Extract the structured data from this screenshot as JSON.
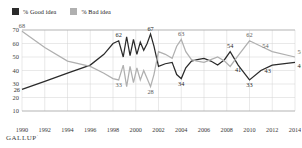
{
  "legend": {
    "entries": [
      {
        "label": "% Good idea",
        "color": "#2b2b2b",
        "key": "good"
      },
      {
        "label": "% Bad idea",
        "color": "#b0b0b0",
        "key": "bad"
      }
    ]
  },
  "brand": {
    "name": "GALLUP",
    "mark": "·"
  },
  "colors": {
    "good": "#2b2b2b",
    "bad": "#b0b0b0",
    "grid": "#d2d2d2",
    "axis": "#9a9a9a",
    "background": "#ffffff"
  },
  "chart_data": {
    "type": "line",
    "title": "",
    "subtitle": "",
    "xlabel": "",
    "ylabel": "",
    "xlim": [
      1990,
      2014
    ],
    "ylim": [
      10,
      70
    ],
    "yticks": [
      10,
      20,
      30,
      40,
      50,
      60,
      70
    ],
    "xticks": [
      1990,
      1992,
      1994,
      1996,
      1998,
      2000,
      2002,
      2004,
      2006,
      2008,
      2010,
      2012,
      2014
    ],
    "grid": true,
    "legend_position": "top-left",
    "series": [
      {
        "name": "% Good idea",
        "key": "good",
        "color": "#2b2b2b",
        "x": [
          1990.0,
          1992.0,
          1994.0,
          1996.0,
          1997.2,
          1998.0,
          1998.5,
          1998.9,
          1999.2,
          1999.5,
          1999.8,
          2000.1,
          2000.4,
          2000.7,
          2001.0,
          2001.3,
          2001.6,
          2002.0,
          2002.6,
          2003.2,
          2003.6,
          2004.0,
          2004.4,
          2004.9,
          2005.4,
          2006.0,
          2006.6,
          2007.2,
          2007.8,
          2008.3,
          2009.0,
          2010.0,
          2011.0,
          2012.0,
          2014.0
        ],
        "y": [
          26,
          32,
          38,
          44,
          52,
          60,
          62,
          50,
          65,
          51,
          63,
          52,
          61,
          55,
          60,
          67,
          58,
          43,
          45,
          46,
          37,
          34,
          42,
          47,
          48,
          49,
          47,
          44,
          48,
          54,
          44,
          33,
          40,
          44,
          46
        ],
        "labeled_points": [
          {
            "x": 1990,
            "y": 26,
            "label": "26",
            "anchor": "left"
          },
          {
            "x": 1998.5,
            "y": 62,
            "label": "62",
            "anchor": "above"
          },
          {
            "x": 2001.3,
            "y": 67,
            "label": "67",
            "anchor": "above"
          },
          {
            "x": 2004.0,
            "y": 34,
            "label": "34",
            "anchor": "below"
          },
          {
            "x": 2008.3,
            "y": 54,
            "label": "54",
            "anchor": "above"
          },
          {
            "x": 2009.0,
            "y": 44,
            "label": "41",
            "anchor": "below"
          },
          {
            "x": 2010.0,
            "y": 33,
            "label": "33",
            "anchor": "below"
          },
          {
            "x": 2011.6,
            "y": 43,
            "label": "43",
            "anchor": "below"
          },
          {
            "x": 2014.0,
            "y": 46,
            "label": "46",
            "anchor": "below-right"
          }
        ]
      },
      {
        "name": "% Bad idea",
        "key": "bad",
        "color": "#b0b0b0",
        "x": [
          1990.0,
          1992.0,
          1994.0,
          1996.0,
          1997.2,
          1998.0,
          1998.5,
          1998.9,
          1999.2,
          1999.5,
          1999.8,
          2000.1,
          2000.4,
          2000.7,
          2001.0,
          2001.3,
          2001.6,
          2002.0,
          2002.6,
          2003.2,
          2003.6,
          2004.0,
          2004.4,
          2004.9,
          2005.4,
          2006.0,
          2006.6,
          2007.2,
          2007.8,
          2008.3,
          2009.0,
          2010.0,
          2011.0,
          2012.0,
          2014.0
        ],
        "y": [
          69,
          57,
          47,
          43,
          38,
          34,
          33,
          44,
          28,
          43,
          31,
          42,
          33,
          40,
          34,
          28,
          37,
          54,
          52,
          49,
          58,
          63,
          54,
          48,
          47,
          46,
          48,
          50,
          47,
          43,
          51,
          62,
          58,
          54,
          50
        ],
        "labeled_points": [
          {
            "x": 1990,
            "y": 69,
            "label": "68",
            "anchor": "above"
          },
          {
            "x": 1998.5,
            "y": 33,
            "label": "33",
            "anchor": "below"
          },
          {
            "x": 2001.3,
            "y": 28,
            "label": "28",
            "anchor": "below"
          },
          {
            "x": 2004.0,
            "y": 63,
            "label": "63",
            "anchor": "above"
          },
          {
            "x": 2010.0,
            "y": 62,
            "label": "62",
            "anchor": "above"
          },
          {
            "x": 2011.4,
            "y": 54,
            "label": "54",
            "anchor": "above"
          },
          {
            "x": 2014.0,
            "y": 50,
            "label": "50",
            "anchor": "above-right"
          }
        ]
      }
    ]
  }
}
